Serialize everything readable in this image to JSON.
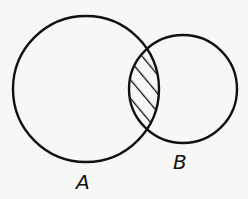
{
  "diagram": {
    "type": "venn",
    "sets": [
      {
        "name": "A",
        "label": "A",
        "cx": 86,
        "cy": 89,
        "r": 73
      },
      {
        "name": "B",
        "label": "B",
        "cx": 183,
        "cy": 89,
        "r": 54
      }
    ],
    "shaded_region": "A ∩ B",
    "shading_style": "diagonal-hatch",
    "stroke_color": "#111111",
    "background_color": "#f7f7f5"
  }
}
